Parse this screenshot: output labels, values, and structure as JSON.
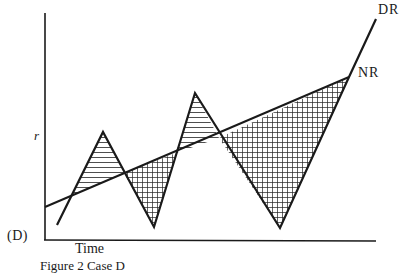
{
  "figure": {
    "panel_label": "(D)",
    "y_axis_label": "r",
    "x_axis_label": "Time",
    "caption": "Figure 2 Case D",
    "lines": [
      {
        "name": "DR",
        "label": "DR",
        "description": "Zig-zag line rising steeply at the end"
      },
      {
        "name": "NR",
        "label": "NR",
        "description": "Straight upward-sloping line"
      }
    ],
    "shading": [
      {
        "pattern": "horizontal-lines",
        "meaning": "DR above NR"
      },
      {
        "pattern": "cross-hatch",
        "meaning": "NR above DR"
      }
    ]
  }
}
